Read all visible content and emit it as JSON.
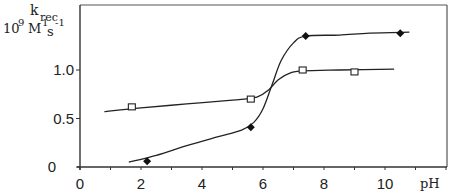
{
  "chart_data": {
    "type": "line",
    "title": "",
    "xlabel": "pH",
    "ylabel": "k_rec 10^9 M^-1 s^-1",
    "ylabel_main": "k",
    "ylabel_sub": "rec",
    "ylabel_units": "10",
    "ylabel_units_exp": "9",
    "ylabel_units_m": "M",
    "ylabel_units_mexp": "1",
    "ylabel_units_s": "s",
    "ylabel_units_sexp": "-1",
    "xlim": [
      0,
      12
    ],
    "ylim": [
      0,
      1.5
    ],
    "x_ticks": [
      0,
      2,
      4,
      6,
      8,
      10
    ],
    "x_tick_labels": [
      "0",
      "2",
      "4",
      "6",
      "8",
      "10"
    ],
    "y_ticks": [
      0,
      0.5,
      1.0
    ],
    "y_tick_labels": [
      "0",
      "0.5",
      "1.0"
    ],
    "grid": false,
    "legend": null,
    "series": [
      {
        "name": "filled diamonds",
        "marker": "diamond-filled",
        "points": [
          {
            "x": 2.2,
            "y": 0.06
          },
          {
            "x": 5.6,
            "y": 0.41
          },
          {
            "x": 7.4,
            "y": 1.35
          },
          {
            "x": 10.5,
            "y": 1.38
          }
        ],
        "fit_curve": [
          [
            1.6,
            0.05
          ],
          [
            2.5,
            0.12
          ],
          [
            3.5,
            0.22
          ],
          [
            4.5,
            0.31
          ],
          [
            5.3,
            0.38
          ],
          [
            5.7,
            0.46
          ],
          [
            6.0,
            0.6
          ],
          [
            6.3,
            0.85
          ],
          [
            6.6,
            1.1
          ],
          [
            7.0,
            1.28
          ],
          [
            7.4,
            1.35
          ],
          [
            8.5,
            1.36
          ],
          [
            9.5,
            1.38
          ],
          [
            10.8,
            1.39
          ]
        ]
      },
      {
        "name": "open squares",
        "marker": "square-open",
        "points": [
          {
            "x": 1.7,
            "y": 0.62
          },
          {
            "x": 5.6,
            "y": 0.7
          },
          {
            "x": 7.3,
            "y": 1.0
          },
          {
            "x": 9.0,
            "y": 0.98
          }
        ],
        "fit_curve": [
          [
            0.8,
            0.57
          ],
          [
            2.0,
            0.61
          ],
          [
            3.5,
            0.65
          ],
          [
            5.0,
            0.69
          ],
          [
            5.8,
            0.72
          ],
          [
            6.2,
            0.8
          ],
          [
            6.5,
            0.9
          ],
          [
            6.9,
            0.97
          ],
          [
            7.3,
            0.99
          ],
          [
            8.5,
            1.0
          ],
          [
            10.3,
            1.01
          ]
        ]
      }
    ]
  }
}
